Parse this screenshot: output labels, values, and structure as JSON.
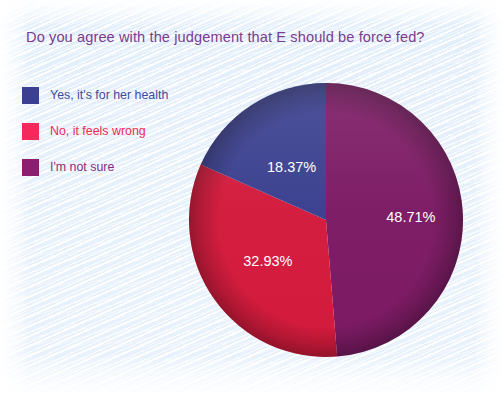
{
  "chart_data": {
    "type": "pie",
    "title": "Do you agree with the judgement that E should be force fed?",
    "categories": [
      "Yes, it's for her health",
      "No, it feels wrong",
      "I'm not sure"
    ],
    "values": [
      18.37,
      32.93,
      48.71
    ],
    "value_labels": [
      "18.37%",
      "32.93%",
      "48.71%"
    ],
    "colors": [
      "#3a3f8f",
      "#d31a3c",
      "#7c1a64"
    ],
    "legend_swatch_colors": [
      "#3b3f92",
      "#f5285c",
      "#8d1d6f"
    ],
    "legend_text_colors": [
      "#3c4a9e",
      "#ef2a53",
      "#8c2a7a"
    ],
    "legend_position": "left",
    "grid": false,
    "units": "percent",
    "start_angle_deg": 0,
    "direction": "clockwise",
    "slice_order": [
      "I'm not sure",
      "No, it feels wrong",
      "Yes, it's for her health"
    ]
  },
  "title": {
    "text": "Do you agree with the judgement that E should be force fed?",
    "color": "#7b3c8e"
  },
  "legend": {
    "items": [
      {
        "label": "Yes, it's for her health",
        "swatch": "#3b3f92",
        "text_color": "#3c4a9e"
      },
      {
        "label": "No, it feels wrong",
        "swatch": "#f5285c",
        "text_color": "#ef2a53"
      },
      {
        "label": "I'm not sure",
        "swatch": "#8d1d6f",
        "text_color": "#8c2a7a"
      }
    ]
  },
  "pie": {
    "slices": [
      {
        "name": "I'm not sure",
        "percent": 48.71,
        "label": "48.71%",
        "color": "#7c1a64"
      },
      {
        "name": "No, it feels wrong",
        "percent": 32.93,
        "label": "32.93%",
        "color": "#d31a3c"
      },
      {
        "name": "Yes, it's for her health",
        "percent": 18.37,
        "label": "18.37%",
        "color": "#3a3f8f"
      }
    ]
  },
  "background": {
    "paper": "#ffffff",
    "panel": "#e4eefb",
    "hatch": "#ffffff"
  }
}
